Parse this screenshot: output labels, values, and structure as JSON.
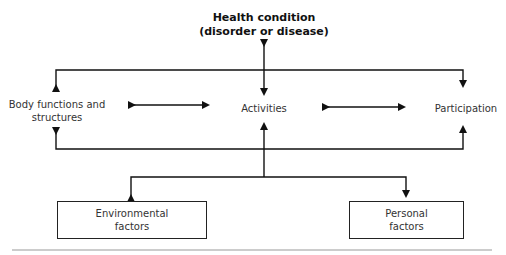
{
  "diagram": {
    "title_line1": "Health condition",
    "title_line2": "(disorder or disease)",
    "nodes": {
      "body_line1": "Body functions and",
      "body_line2": "structures",
      "activities": "Activities",
      "participation": "Participation",
      "environmental_line1": "Environmental",
      "environmental_line2": "factors",
      "personal_line1": "Personal",
      "personal_line2": "factors"
    },
    "edges": [
      {
        "from": "Health condition",
        "to": "Activities",
        "type": "bidirectional"
      },
      {
        "from": "Health condition",
        "to": "Body functions and structures",
        "type": "bidirectional"
      },
      {
        "from": "Health condition",
        "to": "Participation",
        "type": "bidirectional"
      },
      {
        "from": "Body functions and structures",
        "to": "Activities",
        "type": "bidirectional"
      },
      {
        "from": "Activities",
        "to": "Participation",
        "type": "bidirectional"
      },
      {
        "from": "Environmental factors",
        "to": "Activities",
        "type": "bidirectional"
      },
      {
        "from": "Personal factors",
        "to": "Activities",
        "type": "bidirectional"
      }
    ]
  }
}
